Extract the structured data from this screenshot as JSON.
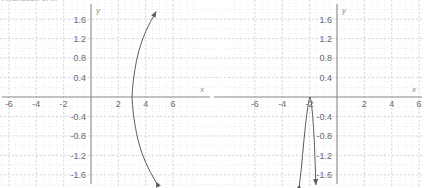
{
  "page": {
    "width": 424,
    "height": 188,
    "background": "#ffffff",
    "clipped_caption": "A function of x."
  },
  "style": {
    "grid_minor_color": "#e3e3ea",
    "grid_major_color": "#d2d2da",
    "axis_color": "#8a8a8a",
    "curve_color": "#5d5d5d",
    "tick_label_color": "#6b6b6b",
    "axis_name_color": "#8a8a8a"
  },
  "chart_data": [
    {
      "id": "left-graph",
      "type": "line",
      "title": "",
      "xlabel": "x",
      "ylabel": "y",
      "xlim": [
        -7.6,
        7.6
      ],
      "ylim": [
        -1.85,
        1.85
      ],
      "grid": true,
      "grid_minor_step_x": 0.5,
      "grid_minor_step_y": 0.2,
      "grid_major_step_x": 2,
      "grid_major_step_y": 0.4,
      "legend": "none",
      "xticks": [
        -6,
        -4,
        -2,
        2,
        4,
        6
      ],
      "xtick_labels": [
        "-6",
        "-4",
        "-2",
        "2",
        "4",
        "6"
      ],
      "yticks": [
        1.6,
        1.2,
        0.8,
        0.4,
        -0.4,
        -0.8,
        -1.2,
        -1.6
      ],
      "ytick_labels": [
        "1.6",
        "1.2",
        "0.8",
        "0.4",
        "-0.4",
        "-0.8",
        "-1.2",
        "-1.6"
      ],
      "description": "Sideways parabola opening rightward, vertex near (3, 0), arrowheads on both ends",
      "arrowheads": [
        "start",
        "end"
      ],
      "series": [
        {
          "name": "curve",
          "points": [
            [
              4.75,
              -1.75
            ],
            [
              4.35,
              -1.55
            ],
            [
              4.0,
              -1.35
            ],
            [
              3.72,
              -1.15
            ],
            [
              3.5,
              -0.95
            ],
            [
              3.33,
              -0.75
            ],
            [
              3.2,
              -0.55
            ],
            [
              3.1,
              -0.35
            ],
            [
              3.03,
              -0.15
            ],
            [
              3.0,
              0.0
            ],
            [
              3.03,
              0.15
            ],
            [
              3.1,
              0.35
            ],
            [
              3.2,
              0.55
            ],
            [
              3.33,
              0.75
            ],
            [
              3.5,
              0.95
            ],
            [
              3.72,
              1.15
            ],
            [
              4.0,
              1.35
            ],
            [
              4.35,
              1.55
            ],
            [
              4.75,
              1.75
            ]
          ]
        }
      ]
    },
    {
      "id": "right-graph",
      "type": "line",
      "title": "",
      "xlabel": "x",
      "ylabel": "y",
      "xlim": [
        -7.6,
        7.6
      ],
      "ylim": [
        -1.85,
        1.85
      ],
      "grid": true,
      "grid_minor_step_x": 0.5,
      "grid_minor_step_y": 0.2,
      "grid_major_step_x": 2,
      "grid_major_step_y": 0.4,
      "legend": "none",
      "xticks": [
        -6,
        -4,
        -2,
        2,
        4,
        6
      ],
      "xtick_labels": [
        "-6",
        "-4",
        "-2",
        "2",
        "4",
        "6"
      ],
      "yticks": [
        1.6,
        1.2,
        0.8,
        0.4,
        -0.4,
        -0.8,
        -1.2,
        -1.6
      ],
      "ytick_labels": [
        "1.6",
        "1.2",
        "0.8",
        "0.4",
        "-0.4",
        "-0.8",
        "-1.2",
        "-1.6"
      ],
      "description": "Narrow downward-opening curve with apex near (-2, 0), two steep branches descending with arrowheads at the bottom",
      "arrowheads": [
        "start",
        "end"
      ],
      "series": [
        {
          "name": "curve",
          "points": [
            [
              -2.75,
              -1.8
            ],
            [
              -2.62,
              -1.5
            ],
            [
              -2.52,
              -1.2
            ],
            [
              -2.42,
              -0.9
            ],
            [
              -2.32,
              -0.62
            ],
            [
              -2.22,
              -0.38
            ],
            [
              -2.12,
              -0.18
            ],
            [
              -2.04,
              -0.05
            ],
            [
              -1.98,
              0.0
            ],
            [
              -1.92,
              -0.05
            ],
            [
              -1.85,
              -0.18
            ],
            [
              -1.78,
              -0.38
            ],
            [
              -1.72,
              -0.62
            ],
            [
              -1.66,
              -0.9
            ],
            [
              -1.62,
              -1.2
            ],
            [
              -1.58,
              -1.5
            ],
            [
              -1.55,
              -1.8
            ]
          ]
        }
      ]
    }
  ]
}
